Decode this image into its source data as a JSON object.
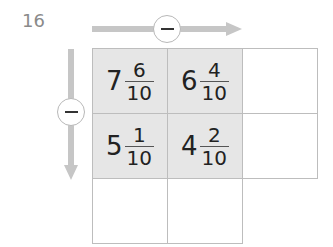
{
  "question": {
    "number": "16"
  },
  "operations": {
    "horizontal": {
      "symbol": "minus",
      "direction": "right"
    },
    "vertical": {
      "symbol": "minus",
      "direction": "down"
    }
  },
  "grid": {
    "rows": [
      [
        {
          "whole": "7",
          "numerator": "6",
          "denominator": "10",
          "filled": true
        },
        {
          "whole": "6",
          "numerator": "4",
          "denominator": "10",
          "filled": true
        },
        {
          "whole": "",
          "numerator": "",
          "denominator": "",
          "filled": false
        }
      ],
      [
        {
          "whole": "5",
          "numerator": "1",
          "denominator": "10",
          "filled": true
        },
        {
          "whole": "4",
          "numerator": "2",
          "denominator": "10",
          "filled": true
        },
        {
          "whole": "",
          "numerator": "",
          "denominator": "",
          "filled": false
        }
      ],
      [
        {
          "whole": "",
          "numerator": "",
          "denominator": "",
          "filled": false
        },
        {
          "whole": "",
          "numerator": "",
          "denominator": "",
          "filled": false
        }
      ]
    ]
  },
  "colors": {
    "arrow": "#c6c6c6",
    "filled_cell": "#e6e6e6",
    "border": "#bdbdbd",
    "question_number": "#8a8a8a"
  }
}
